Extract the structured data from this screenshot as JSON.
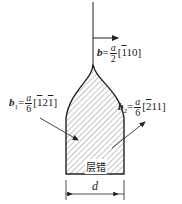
{
  "diagram": {
    "burgers_total": {
      "symbol": "b",
      "eq": "=",
      "num": "a",
      "den": "2",
      "dir_open": "[",
      "dir_bar": "1",
      "dir_rest": "10",
      "dir_close": "]"
    },
    "partial_1": {
      "symbol": "b",
      "sub": "1",
      "eq": "=",
      "num": "a",
      "den": "6",
      "dir_open": "[",
      "d1": "1",
      "d2": "2",
      "d3": "1",
      "dir_close": "]",
      "bars": [
        "1",
        "3"
      ]
    },
    "partial_2": {
      "symbol": "b",
      "sub": "2",
      "eq": "=",
      "num": "a",
      "den": "6",
      "dir_open": "[",
      "d1": "2",
      "d2": "1",
      "d3": "1",
      "dir_close": "]",
      "bars": [
        "1"
      ]
    },
    "fault_label": "层错",
    "width_label": "d"
  }
}
